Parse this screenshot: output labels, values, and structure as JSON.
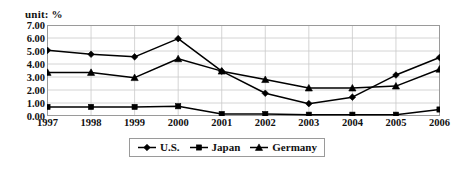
{
  "chart_data": {
    "type": "line",
    "title": "",
    "unit_label": "unit: %",
    "xlabel": "",
    "ylabel": "",
    "categories": [
      "1997",
      "1998",
      "1999",
      "2000",
      "2001",
      "2002",
      "2003",
      "2004",
      "2005",
      "2006"
    ],
    "ylim": [
      0.0,
      7.0
    ],
    "ytick_labels": [
      "7.00",
      "6.00",
      "5.00",
      "4.00",
      "3.00",
      "2.00",
      "1.00",
      "0.00"
    ],
    "ytick_values": [
      7.0,
      6.0,
      5.0,
      4.0,
      3.0,
      2.0,
      1.0,
      0.0
    ],
    "grid": true,
    "legend_position": "bottom",
    "series": [
      {
        "name": "U.S.",
        "marker": "diamond",
        "color": "#000000",
        "values": [
          5.05,
          4.75,
          4.55,
          5.95,
          3.45,
          1.75,
          0.95,
          1.45,
          3.15,
          4.5
        ]
      },
      {
        "name": "Japan",
        "marker": "square",
        "color": "#000000",
        "values": [
          0.7,
          0.7,
          0.7,
          0.75,
          0.15,
          0.15,
          0.1,
          0.1,
          0.1,
          0.5
        ]
      },
      {
        "name": "Germany",
        "marker": "triangle",
        "color": "#000000",
        "values": [
          3.35,
          3.35,
          2.95,
          4.4,
          3.45,
          2.8,
          2.15,
          2.15,
          2.3,
          3.6
        ]
      }
    ]
  },
  "legend": {
    "items": [
      {
        "label": "U.S."
      },
      {
        "label": "Japan"
      },
      {
        "label": "Germany"
      }
    ]
  }
}
